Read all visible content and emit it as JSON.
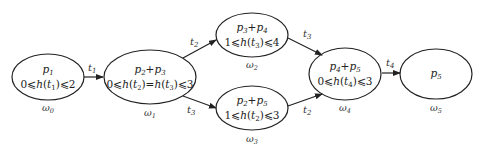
{
  "diagram": {
    "nodes": [
      {
        "id": "w0",
        "title": "p1",
        "title_main": "p",
        "title_sub": "1",
        "constraint": "0⩽h(t1)⩽2",
        "caption_main": "ω",
        "caption_sub": "0"
      },
      {
        "id": "w1",
        "title": "p2+p3",
        "constraint": "0⩽h(t2)=h(t3)⩽3",
        "caption_main": "ω",
        "caption_sub": "1"
      },
      {
        "id": "w2",
        "title": "p3+p4",
        "constraint": "1⩽h(t3)⩽4",
        "caption_main": "ω",
        "caption_sub": "2"
      },
      {
        "id": "w3",
        "title": "p2+p5",
        "constraint": "1⩽h(t2)⩽3",
        "caption_main": "ω",
        "caption_sub": "3"
      },
      {
        "id": "w4",
        "title": "p4+p5",
        "constraint": "0⩽h(t4)⩽3",
        "caption_main": "ω",
        "caption_sub": "4"
      },
      {
        "id": "w5",
        "title": "p5",
        "constraint": "",
        "caption_main": "ω",
        "caption_sub": "5"
      }
    ],
    "edges": [
      {
        "from": "w0",
        "to": "w1",
        "label_main": "t",
        "label_sub": "1"
      },
      {
        "from": "w1",
        "to": "w2",
        "label_main": "t",
        "label_sub": "2"
      },
      {
        "from": "w1",
        "to": "w3",
        "label_main": "t",
        "label_sub": "3"
      },
      {
        "from": "w2",
        "to": "w4",
        "label_main": "t",
        "label_sub": "3"
      },
      {
        "from": "w3",
        "to": "w4",
        "label_main": "t",
        "label_sub": "2"
      },
      {
        "from": "w4",
        "to": "w5",
        "label_main": "t",
        "label_sub": "4"
      }
    ],
    "text": {
      "le": "⩽",
      "p": "p",
      "h": "h",
      "t": "t",
      "plus": "+",
      "eq": "=",
      "lp": "(",
      "rp": ")",
      "n0": "0",
      "n1": "1",
      "n2": "2",
      "n3": "3",
      "n4": "4",
      "n5": "5"
    }
  }
}
